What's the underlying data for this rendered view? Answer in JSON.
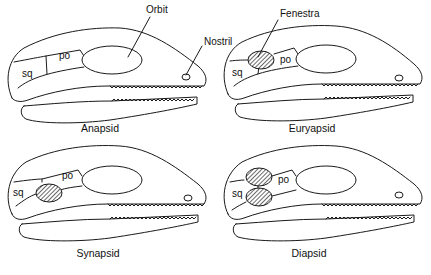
{
  "figure": {
    "panels": [
      {
        "id": "anapsid",
        "caption": "Anapsid",
        "fenestra_count": 0,
        "labels": {
          "squamosal": "sq",
          "postorbital": "po"
        },
        "callouts": [
          "Orbit",
          "Nostril"
        ]
      },
      {
        "id": "euryapsid",
        "caption": "Euryapsid",
        "fenestra_count": 1,
        "fenestra_position": "upper",
        "labels": {
          "squamosal": "sq",
          "postorbital": "po"
        },
        "callouts": [
          "Fenestra"
        ]
      },
      {
        "id": "synapsid",
        "caption": "Synapsid",
        "fenestra_count": 1,
        "fenestra_position": "lower",
        "labels": {
          "squamosal": "sq",
          "postorbital": "po"
        },
        "callouts": []
      },
      {
        "id": "diapsid",
        "caption": "Diapsid",
        "fenestra_count": 2,
        "fenestra_position": "upper-and-lower",
        "labels": {
          "squamosal": "sq",
          "postorbital": "po"
        },
        "callouts": []
      }
    ],
    "callout_text": {
      "orbit": "Orbit",
      "nostril": "Nostril",
      "fenestra": "Fenestra"
    },
    "colors": {
      "line": "#1a1a1a",
      "background": "#ffffff"
    }
  }
}
